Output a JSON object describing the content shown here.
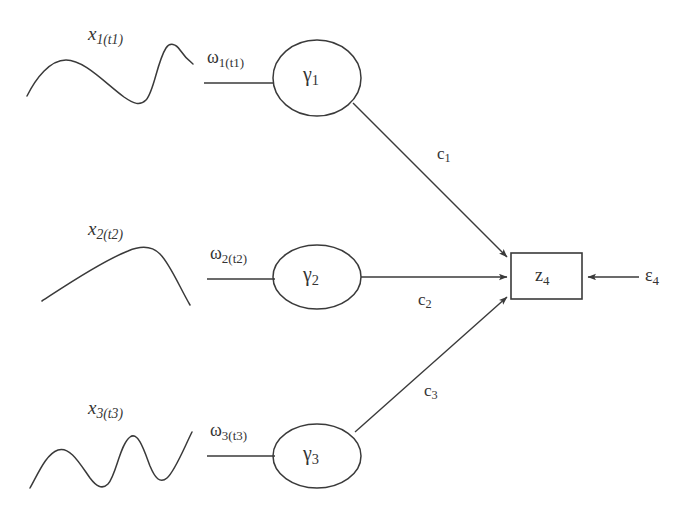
{
  "diagram": {
    "background_color": "#ffffff",
    "stroke_color": "#3a3a3a",
    "channels": [
      {
        "signal_label": "x",
        "signal_sub": "1(t1)",
        "weight_label": "ω",
        "weight_sub": "1(t1)",
        "node_label": "γ",
        "node_sub": "1",
        "coefficient_label": "c",
        "coefficient_sub": "1",
        "waveform": "rise-fall-sharp-peak"
      },
      {
        "signal_label": "x",
        "signal_sub": "2(t2)",
        "weight_label": "ω",
        "weight_sub": "2(t2)",
        "node_label": "γ",
        "node_sub": "2",
        "coefficient_label": "c",
        "coefficient_sub": "2",
        "waveform": "single-hump"
      },
      {
        "signal_label": "x",
        "signal_sub": "3(t3)",
        "weight_label": "ω",
        "weight_sub": "3(t3)",
        "node_label": "γ",
        "node_sub": "3",
        "coefficient_label": "c",
        "coefficient_sub": "3",
        "waveform": "oscillating"
      }
    ],
    "output": {
      "box_label": "z",
      "box_sub": "4",
      "noise_label": "ε",
      "noise_sub": "4"
    }
  }
}
